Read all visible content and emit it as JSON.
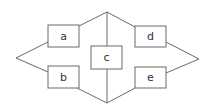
{
  "diagram": {
    "nodes": [
      {
        "id": "a",
        "label": "a",
        "x": 48,
        "y": 25,
        "w": 31,
        "h": 22
      },
      {
        "id": "b",
        "label": "b",
        "x": 48,
        "y": 66,
        "w": 31,
        "h": 22
      },
      {
        "id": "c",
        "label": "c",
        "x": 91,
        "y": 46,
        "w": 31,
        "h": 23
      },
      {
        "id": "d",
        "label": "d",
        "x": 135,
        "y": 26,
        "w": 31,
        "h": 21
      },
      {
        "id": "e",
        "label": "e",
        "x": 135,
        "y": 67,
        "w": 31,
        "h": 21
      }
    ],
    "colors": {
      "stroke": "#6a6a6a",
      "text": "#333333",
      "background": "#ffffff"
    }
  }
}
